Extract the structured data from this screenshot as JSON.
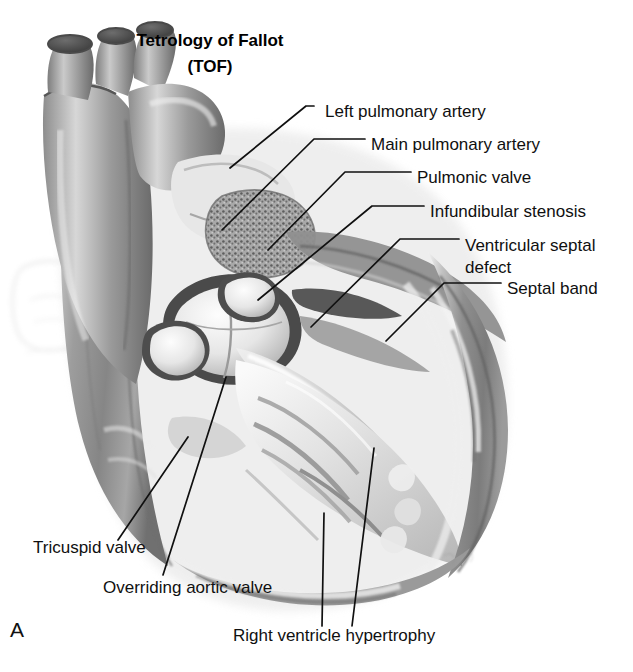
{
  "figure": {
    "title_line1": "Tetrology of Fallot",
    "title_line2": "(TOF)",
    "panel_letter": "A",
    "style": "grayscale-medical-illustration",
    "background_color": "#ffffff",
    "ink_color": "#101010"
  },
  "labels": [
    {
      "id": "left-pulmonary-artery",
      "text": "Left pulmonary artery",
      "x": 325,
      "y": 112
    },
    {
      "id": "main-pulmonary-artery",
      "text": "Main pulmonary artery",
      "x": 371,
      "y": 145
    },
    {
      "id": "pulmonic-valve",
      "text": "Pulmonic valve",
      "x": 417,
      "y": 178
    },
    {
      "id": "infundibular-stenosis",
      "text": "Infundibular stenosis",
      "x": 430,
      "y": 212
    },
    {
      "id": "ventricular-septal-defect",
      "text": "Ventricular septal",
      "text2": "defect",
      "x": 465,
      "y": 245
    },
    {
      "id": "septal-band",
      "text": "Septal band",
      "x": 507,
      "y": 289
    },
    {
      "id": "tricuspid-valve",
      "text": "Tricuspid valve",
      "x": 33,
      "y": 548
    },
    {
      "id": "overriding-aortic-valve",
      "text": "Overriding aortic valve",
      "x": 103,
      "y": 588
    },
    {
      "id": "right-ventricle-hypertrophy",
      "text": "Right ventricle hypertrophy",
      "x": 233,
      "y": 636
    }
  ],
  "leaders": [
    {
      "id": "leader-left-pulmonary-artery",
      "points": "314,106 306,106 230,168"
    },
    {
      "id": "leader-main-pulmonary-artery",
      "points": "365,139 314,139 222,230"
    },
    {
      "id": "leader-pulmonic-valve",
      "points": "411,172 345,172 268,250"
    },
    {
      "id": "leader-infundibular-stenosis",
      "points": "424,206 372,206 258,300"
    },
    {
      "id": "leader-ventricular-septal-defect",
      "points": "459,239 400,239 311,327"
    },
    {
      "id": "leader-septal-band",
      "points": "501,283 444,283 386,341"
    },
    {
      "id": "leader-tricuspid-valve",
      "points": "118,540 188,437"
    },
    {
      "id": "leader-overriding-aortic-valve",
      "points": "163,575 226,377"
    },
    {
      "id": "leader-rvh-a",
      "points": "322,626 324,513"
    },
    {
      "id": "leader-rvh-b",
      "points": "352,626 374,448"
    }
  ],
  "anatomy_regions": [
    {
      "id": "aortic-arch",
      "label": "aortic arch with brachiocephalic branches"
    },
    {
      "id": "pulmonary-trunk",
      "label": "main pulmonary artery trunk"
    },
    {
      "id": "pulmonic-valve-region",
      "label": "stenotic pulmonic valve, stippled texture"
    },
    {
      "id": "aortic-valve-cusps",
      "label": "overriding aortic valve cusps"
    },
    {
      "id": "right-ventricle-wall",
      "label": "hypertrophied right ventricular free wall"
    },
    {
      "id": "interventricular-septum",
      "label": "interventricular septum with defect"
    },
    {
      "id": "trabeculae",
      "label": "trabeculae carneae of right ventricle"
    },
    {
      "id": "left-atrial-ghost",
      "label": "faint ghosted atrial appendage"
    }
  ]
}
